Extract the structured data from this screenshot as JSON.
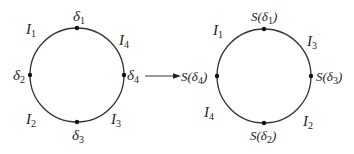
{
  "left_circle": {
    "points": [
      {
        "name": "δ1",
        "base": "δ",
        "sub": "1",
        "pos": "top"
      },
      {
        "name": "δ2",
        "base": "δ",
        "sub": "2",
        "pos": "left"
      },
      {
        "name": "δ3",
        "base": "δ",
        "sub": "3",
        "pos": "bottom"
      },
      {
        "name": "δ4",
        "base": "δ",
        "sub": "4",
        "pos": "right"
      }
    ],
    "arcs": [
      {
        "base": "I",
        "sub": "1",
        "pos": "top-left"
      },
      {
        "base": "I",
        "sub": "4",
        "pos": "top-right"
      },
      {
        "base": "I",
        "sub": "2",
        "pos": "bottom-left"
      },
      {
        "base": "I",
        "sub": "3",
        "pos": "bottom-right"
      }
    ]
  },
  "right_circle": {
    "points": [
      {
        "prefix": "S(",
        "base": "δ",
        "sub": "1",
        "suffix": ")",
        "pos": "top"
      },
      {
        "prefix": "S(",
        "base": "δ",
        "sub": "4",
        "suffix": ")",
        "pos": "left"
      },
      {
        "prefix": "S(",
        "base": "δ",
        "sub": "2",
        "suffix": ")",
        "pos": "bottom"
      },
      {
        "prefix": "S(",
        "base": "δ",
        "sub": "3",
        "suffix": ")",
        "pos": "right"
      }
    ],
    "arcs": [
      {
        "base": "I",
        "sub": "1",
        "pos": "top-left"
      },
      {
        "base": "I",
        "sub": "3",
        "pos": "top-right"
      },
      {
        "base": "I",
        "sub": "4",
        "pos": "bottom-left"
      },
      {
        "base": "I",
        "sub": "2",
        "pos": "bottom-right"
      }
    ]
  },
  "arrow": {
    "from": "left_circle",
    "to": "right_circle"
  }
}
